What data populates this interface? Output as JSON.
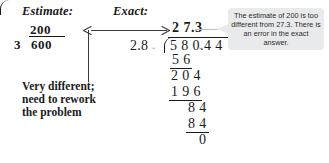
{
  "headings": {
    "estimate": "Estimate:",
    "exact": "Exact:"
  },
  "estimate_problem": {
    "quotient": "200",
    "divisor": "3",
    "dividend": "600"
  },
  "annotation": {
    "line1": "Very different;",
    "line2": "need to rework",
    "line3": "the problem"
  },
  "exact_problem": {
    "quotient": "2 7.3",
    "divisor": "2.8",
    "dividend": "5 8 0.4 4",
    "steps": [
      {
        "value": "5 6",
        "name": "step-1-subtrahend"
      },
      {
        "value": "2 0 4",
        "name": "step-1-remainder"
      },
      {
        "value": "1 9 6",
        "name": "step-2-subtrahend"
      },
      {
        "value": "8 4",
        "name": "step-2-remainder"
      },
      {
        "value": "8 4",
        "name": "step-3-subtrahend"
      },
      {
        "value": "0",
        "name": "final-remainder"
      }
    ],
    "caret_divisor": "ˇ",
    "caret_dividend": "ˇ"
  },
  "callout": {
    "text": "The estimate of 200 is too different from 27.3. There is an error in the exact answer.",
    "background": "#e9eaec"
  },
  "colors": {
    "ink": "#1a1a1a",
    "rule": "#3a3a3a",
    "caret": "#9a9a9a",
    "callout_bg": "#e9eaec",
    "page_bg": "#ffffff"
  }
}
